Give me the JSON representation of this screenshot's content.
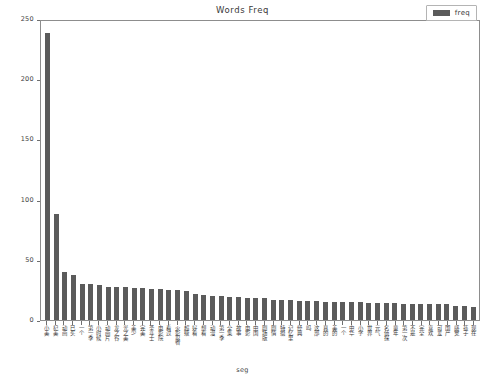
{
  "chart_data": {
    "type": "bar",
    "title": "Words Freq",
    "xlabel": "seg",
    "ylabel": "",
    "ylim": [
      0,
      250
    ],
    "yticks": [
      0,
      50,
      100,
      150,
      200,
      250
    ],
    "grid": false,
    "legend": {
      "position": "upper right",
      "entries": [
        "freq"
      ]
    },
    "series": [
      {
        "name": "freq",
        "color": "#5b5b5b",
        "values": [
          240,
          89,
          40,
          38,
          30,
          30,
          29,
          28,
          28,
          28,
          27,
          27,
          26,
          26,
          25,
          25,
          24,
          22,
          21,
          20,
          20,
          19,
          19,
          18,
          18,
          18,
          17,
          17,
          17,
          16,
          16,
          16,
          15,
          15,
          15,
          15,
          15,
          14,
          14,
          14,
          14,
          13,
          13,
          13,
          13,
          13,
          13,
          12,
          12,
          11
        ]
      }
    ],
    "categories": [
      "小美",
      "杞美",
      "动画",
      "已买",
      "一个",
      "第一季",
      "小时候",
      "动画片",
      "龙之谷",
      "光之美",
      "美少",
      "完美",
      "圣斗士",
      "电影院",
      "看过",
      "火影忍者",
      "超级",
      "好看",
      "想看",
      "动漫",
      "第一季",
      "全集",
      "故事",
      "电影",
      "中国",
      "剧场版",
      "剧情",
      "特摄",
      "记忆里",
      "经典",
      "吗",
      "这部",
      "真的",
      "美的",
      "一个",
      "中华",
      "小学",
      "世界",
      "元气",
      "名侦探",
      "童年",
      "第一次",
      "不是",
      "完全",
      "喜欢",
      "可爱",
      "国产",
      "感觉",
      "孩子",
      "现在"
    ]
  },
  "legend": {
    "label": "freq"
  },
  "axis": {
    "y_tick_labels": [
      "0",
      "50",
      "100",
      "150",
      "200",
      "250"
    ],
    "x_title": "seg"
  },
  "title": {
    "text": "Words Freq"
  },
  "colors": {
    "bar": "#5b5b5b",
    "axis": "#8d8d8d",
    "text": "#3d3d3d"
  }
}
